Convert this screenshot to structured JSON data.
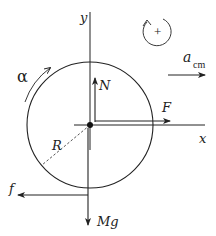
{
  "diagram": {
    "type": "free-body-diagram",
    "colors": {
      "stroke": "#222222",
      "background": "#ffffff",
      "dashed_radius": "#555555"
    },
    "axes": {
      "x_label": "x",
      "y_label": "y"
    },
    "body": {
      "shape": "circle",
      "radius_label": "R"
    },
    "forces": {
      "normal": "N",
      "applied": "F",
      "friction": "f",
      "weight": "Mg"
    },
    "angular_acceleration": {
      "label": "α"
    },
    "sign_convention": {
      "symbol": "+",
      "direction": "counterclockwise"
    },
    "linear_acceleration": {
      "label": "a",
      "subscript": "cm"
    }
  }
}
